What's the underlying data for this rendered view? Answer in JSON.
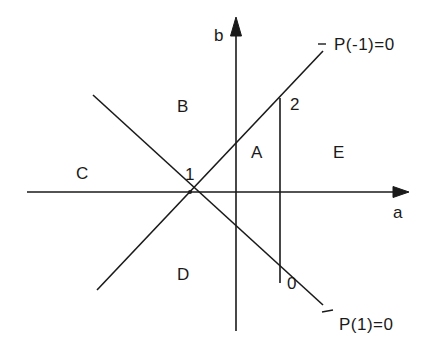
{
  "diagram": {
    "axes": {
      "horizontal_label": "a",
      "vertical_label": "b"
    },
    "lines": [
      {
        "name": "P(-1)=0",
        "label": "P(-1)=0"
      },
      {
        "name": "P(1)=0",
        "label": "P(1)=0"
      }
    ],
    "regions": {
      "A": "A",
      "B": "B",
      "C": "C",
      "D": "D",
      "E": "E"
    },
    "points": {
      "p1": "1",
      "p2": "2",
      "p0": "0"
    },
    "colors": {
      "stroke": "#1a1a1a",
      "background": "#ffffff"
    }
  }
}
